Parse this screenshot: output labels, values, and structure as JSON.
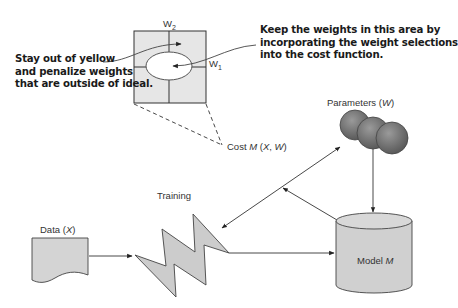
{
  "annotations": {
    "left": {
      "lines": [
        "Stay out of yellow",
        "and penalize weights",
        "that are outside of ideal."
      ]
    },
    "right": {
      "lines": [
        "Keep the weights in this area by",
        "incorporating the weight selections",
        "into the cost function."
      ]
    }
  },
  "weight_space": {
    "axis_w2_label": "W",
    "axis_w2_sub": "2",
    "axis_w1_label": "W",
    "axis_w1_sub": "1",
    "region_fill": "#e6e6e6",
    "ideal_fill": "#ffffff"
  },
  "cost_label": {
    "prefix": "Cost ",
    "fn": "M",
    "args_open": " (",
    "x": "X",
    "sep": ", ",
    "w": "W",
    "args_close": ")"
  },
  "nodes": {
    "parameters": {
      "label": "Parameters (",
      "var": "W",
      "close": ")",
      "color": "#6e6e6e"
    },
    "training": {
      "label": "Training",
      "color": "#cccccc"
    },
    "data": {
      "label": "Data (",
      "var": "X",
      "close": ")",
      "color": "#d4d4d4"
    },
    "model": {
      "label": "Model ",
      "var": "M",
      "color": "#d0d0d0"
    }
  }
}
